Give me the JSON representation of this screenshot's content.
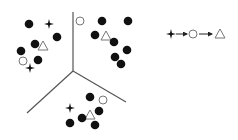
{
  "diagram": {
    "colors": {
      "background": "#ffffff",
      "ink": "#111111",
      "line": "#555555",
      "open_shape": "#777777"
    },
    "dividers": {
      "junction": [
        73,
        71
      ],
      "lines": [
        {
          "name": "vertical-divider",
          "from": [
            73,
            12
          ],
          "to": [
            73,
            71
          ]
        },
        {
          "name": "lower-left-divider",
          "from": [
            73,
            71
          ],
          "to": [
            27,
            113
          ]
        },
        {
          "name": "lower-right-divider",
          "from": [
            73,
            71
          ],
          "to": [
            126,
            102
          ]
        }
      ]
    },
    "clusters": [
      {
        "name": "upper-left-cluster",
        "items": [
          {
            "type": "dot",
            "x": 29,
            "y": 24
          },
          {
            "type": "star",
            "x": 49,
            "y": 24
          },
          {
            "type": "dot",
            "x": 57,
            "y": 37
          },
          {
            "type": "dot",
            "x": 35,
            "y": 44
          },
          {
            "type": "triangle",
            "x": 43,
            "y": 46
          },
          {
            "type": "dot",
            "x": 21,
            "y": 51
          },
          {
            "type": "circle",
            "x": 23,
            "y": 61
          },
          {
            "type": "dot",
            "x": 38,
            "y": 60
          },
          {
            "type": "star",
            "x": 30,
            "y": 68
          }
        ]
      },
      {
        "name": "upper-right-cluster",
        "items": [
          {
            "type": "circle",
            "x": 80,
            "y": 21
          },
          {
            "type": "dot",
            "x": 102,
            "y": 21
          },
          {
            "type": "dot",
            "x": 128,
            "y": 21
          },
          {
            "type": "dot",
            "x": 95,
            "y": 35
          },
          {
            "type": "triangle",
            "x": 106,
            "y": 36
          },
          {
            "type": "dot",
            "x": 114,
            "y": 42
          },
          {
            "type": "dot",
            "x": 127,
            "y": 50
          },
          {
            "type": "dot",
            "x": 115,
            "y": 57
          },
          {
            "type": "dot",
            "x": 121,
            "y": 64
          }
        ]
      },
      {
        "name": "bottom-cluster",
        "items": [
          {
            "type": "dot",
            "x": 90,
            "y": 97
          },
          {
            "type": "circle",
            "x": 103,
            "y": 100
          },
          {
            "type": "star",
            "x": 70,
            "y": 108
          },
          {
            "type": "dot",
            "x": 99,
            "y": 111
          },
          {
            "type": "triangle",
            "x": 90,
            "y": 115
          },
          {
            "type": "dot",
            "x": 82,
            "y": 118
          },
          {
            "type": "dot",
            "x": 70,
            "y": 123
          },
          {
            "type": "dot",
            "x": 95,
            "y": 125
          }
        ]
      }
    ],
    "legend": {
      "sequence": [
        {
          "type": "star",
          "x": 171,
          "y": 34
        },
        {
          "type": "arrow",
          "from": [
            176,
            34
          ],
          "to": [
            187,
            34
          ]
        },
        {
          "type": "circle",
          "x": 193,
          "y": 34
        },
        {
          "type": "arrow",
          "from": [
            199,
            34
          ],
          "to": [
            212,
            34
          ]
        },
        {
          "type": "triangle",
          "x": 220,
          "y": 34
        }
      ]
    }
  }
}
